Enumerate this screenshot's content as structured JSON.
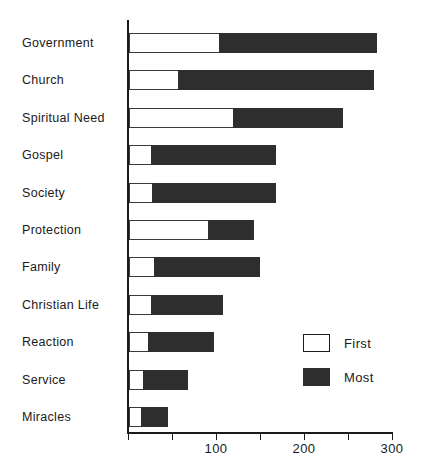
{
  "chart_data": {
    "type": "bar",
    "orientation": "horizontal",
    "stacked": true,
    "title": "",
    "xlabel": "",
    "ylabel": "",
    "xlim": [
      0,
      300
    ],
    "grid": false,
    "legend_position": "inside-right",
    "categories": [
      "Government",
      "Church",
      "Spiritual Need",
      "Gospel",
      "Society",
      "Protection",
      "Family",
      "Christian Life",
      "Reaction",
      "Service",
      "Miracles"
    ],
    "series": [
      {
        "name": "First",
        "color": "#ffffff",
        "values": [
          102,
          56,
          118,
          25,
          26,
          90,
          28,
          25,
          22,
          16,
          14
        ]
      },
      {
        "name": "Most",
        "color": "#2e2e2e",
        "values": [
          180,
          222,
          125,
          142,
          141,
          52,
          121,
          82,
          75,
          51,
          30
        ]
      }
    ],
    "totals": [
      282,
      278,
      243,
      167,
      167,
      142,
      149,
      107,
      97,
      67,
      44
    ],
    "xticks": [
      0,
      50,
      100,
      150,
      200,
      250,
      300
    ],
    "xtick_labels": [
      "",
      "",
      "100",
      "",
      "200",
      "",
      "300"
    ]
  },
  "legend": {
    "items": [
      {
        "label": "First",
        "swatch": "open-square-swatch"
      },
      {
        "label": "Most",
        "swatch": "filled-square-swatch"
      }
    ]
  }
}
